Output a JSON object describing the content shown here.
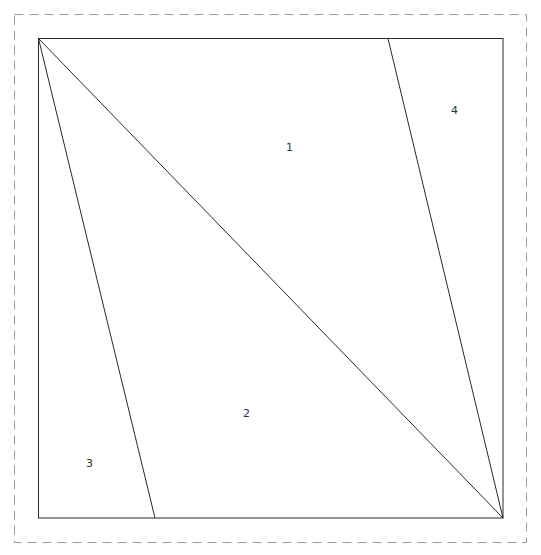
{
  "diagram": {
    "type": "quilt-block-piecing-template",
    "outer_border": {
      "style": "dashed",
      "color": "#9a9a9a"
    },
    "square": {
      "color": "#2a2a2a"
    },
    "pieces": [
      {
        "label": "1"
      },
      {
        "label": "2"
      },
      {
        "label": "3"
      },
      {
        "label": "4"
      }
    ]
  }
}
